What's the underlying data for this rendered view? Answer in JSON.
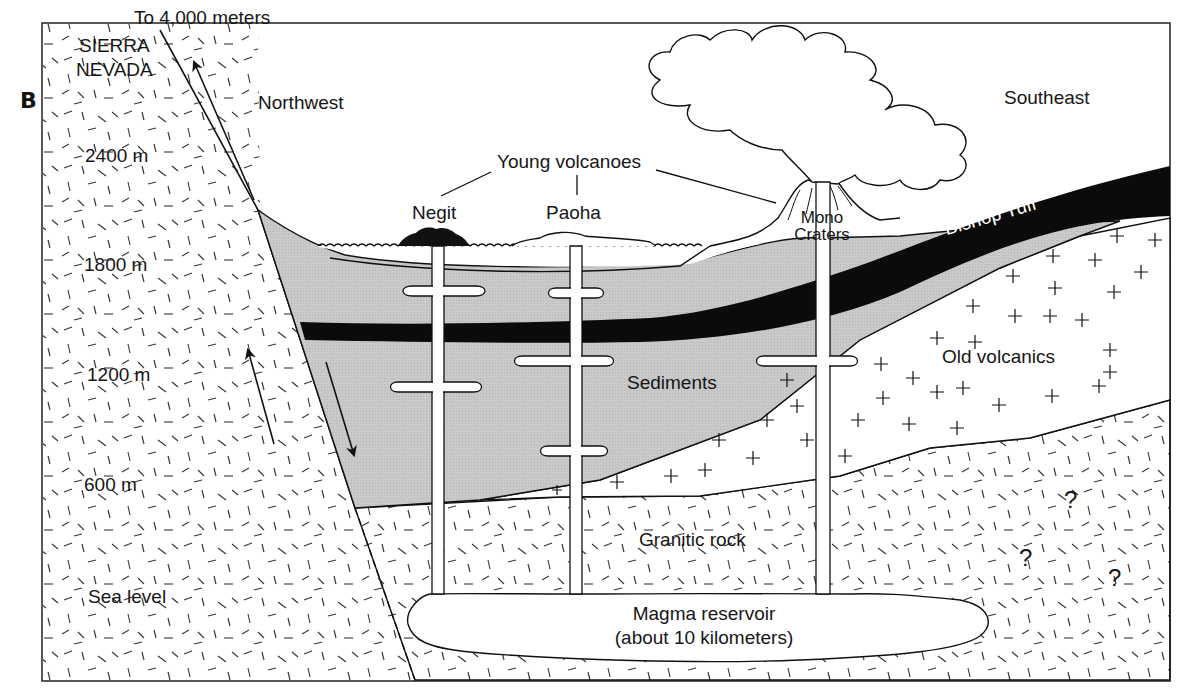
{
  "figure": {
    "panel_label": "B",
    "colors": {
      "ink": "#1a1a1a",
      "sediment_gray": "#c8c8c8",
      "bishop_tuff": "#0b0b0b",
      "background": "#ffffff"
    }
  },
  "elevation_scale": {
    "top_note": "To 4,000 meters",
    "range_label_line1": "SIERRA",
    "range_label_line2": "NEVADA",
    "ticks": [
      "2400 m",
      "1800 m",
      "1200 m",
      "600 m",
      "Sea level"
    ]
  },
  "directions": {
    "left": "Northwest",
    "right": "Southeast"
  },
  "volcanoes": {
    "group_label": "Young volcanoes",
    "items": [
      "Negit",
      "Paoha",
      "Mono Craters"
    ],
    "mono_line1": "Mono",
    "mono_line2": "Craters"
  },
  "layers": {
    "bishop_tuff": "Bishop Tuff",
    "old_volcanics": "Old volcanics",
    "sediments": "Sediments",
    "granitic_rock": "Granitic rock",
    "magma_line1": "Magma reservoir",
    "magma_line2": "(about 10 kilometers)"
  },
  "unknowns": [
    "?",
    "?",
    "?"
  ],
  "fault": {
    "up_arrow": "Sierra Nevada block moves up",
    "down_arrow": "Basin block moves down"
  }
}
